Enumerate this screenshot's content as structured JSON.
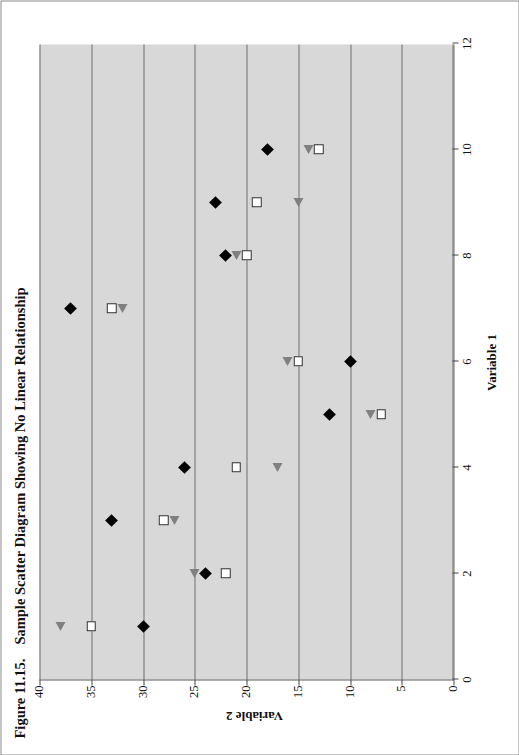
{
  "figure": {
    "number": "Figure 11.15.",
    "title": "Sample Scatter Diagram Showing No Linear Relationship"
  },
  "chart_data": {
    "type": "scatter",
    "title": "Sample Scatter Diagram Showing No Linear Relationship",
    "xlabel": "Variable 1",
    "ylabel": "Variable 2",
    "xlim": [
      0,
      12
    ],
    "ylim": [
      0,
      40
    ],
    "xticks": [
      0,
      2,
      4,
      6,
      8,
      10,
      12
    ],
    "yticks": [
      0,
      5,
      10,
      15,
      20,
      25,
      30,
      35,
      40
    ],
    "grid": "horizontal",
    "legend": "none",
    "rotation_deg": -90,
    "plot_background": "#d8d8d8",
    "page_background": "#ffffff",
    "series": [
      {
        "name": "diamond-series",
        "marker": "filled-diamond",
        "color": "#000000",
        "points": [
          {
            "x": 1,
            "y": 30
          },
          {
            "x": 2,
            "y": 24
          },
          {
            "x": 3,
            "y": 33
          },
          {
            "x": 4,
            "y": 26
          },
          {
            "x": 5,
            "y": 12
          },
          {
            "x": 6,
            "y": 10
          },
          {
            "x": 7,
            "y": 37
          },
          {
            "x": 8,
            "y": 22
          },
          {
            "x": 9,
            "y": 23
          },
          {
            "x": 10,
            "y": 18
          }
        ]
      },
      {
        "name": "square-series",
        "marker": "open-square",
        "color": "#ffffff",
        "edge_color": "#2b2b2b",
        "points": [
          {
            "x": 1,
            "y": 35
          },
          {
            "x": 2,
            "y": 22
          },
          {
            "x": 3,
            "y": 28
          },
          {
            "x": 4,
            "y": 21
          },
          {
            "x": 5,
            "y": 7
          },
          {
            "x": 6,
            "y": 15
          },
          {
            "x": 7,
            "y": 33
          },
          {
            "x": 8,
            "y": 20
          },
          {
            "x": 9,
            "y": 19
          },
          {
            "x": 10,
            "y": 13
          }
        ]
      },
      {
        "name": "triangle-series",
        "marker": "left-triangle",
        "color": "#808080",
        "points": [
          {
            "x": 1,
            "y": 38
          },
          {
            "x": 2,
            "y": 25
          },
          {
            "x": 3,
            "y": 27
          },
          {
            "x": 4,
            "y": 17
          },
          {
            "x": 5,
            "y": 8
          },
          {
            "x": 6,
            "y": 16
          },
          {
            "x": 7,
            "y": 32
          },
          {
            "x": 8,
            "y": 21
          },
          {
            "x": 9,
            "y": 15
          },
          {
            "x": 10,
            "y": 14
          }
        ]
      }
    ]
  }
}
